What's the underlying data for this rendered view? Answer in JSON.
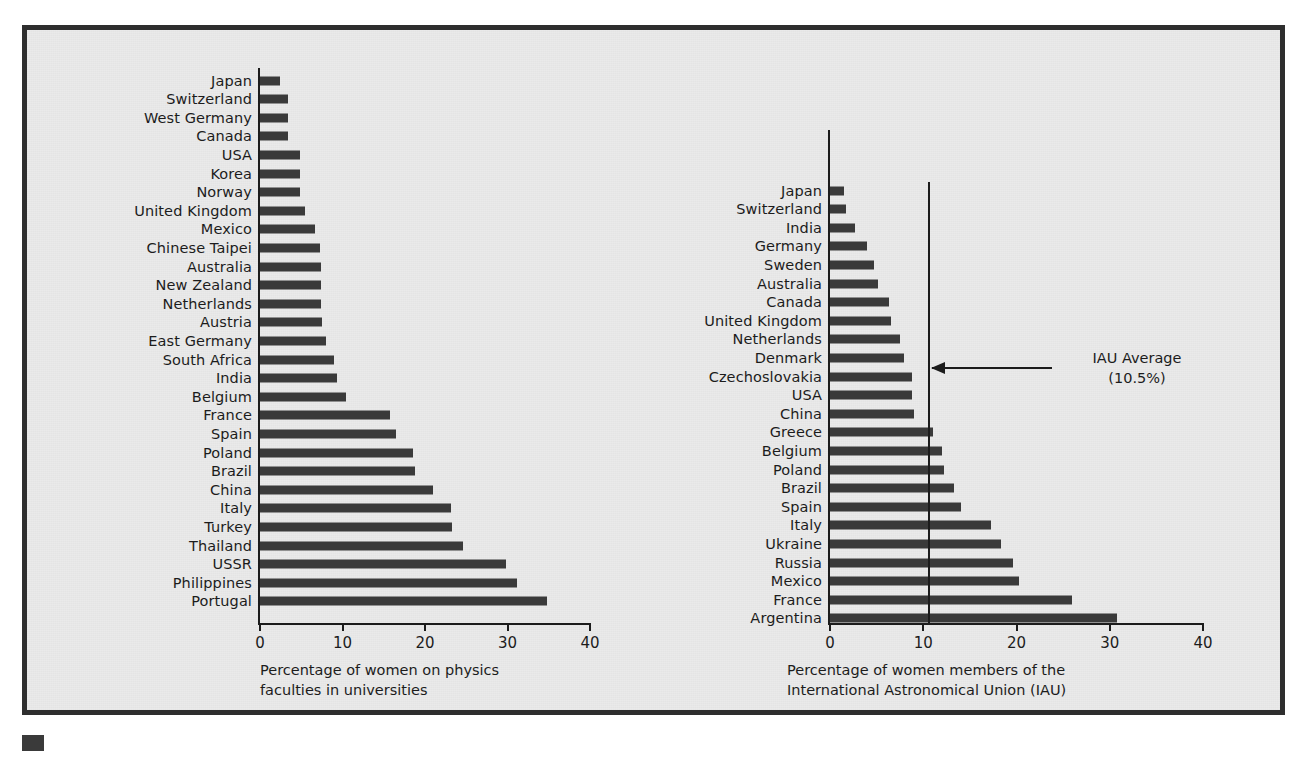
{
  "figure": {
    "background_color": "#eaeaea",
    "frame_color": "#2e2e2e",
    "bar_color": "#3a3a3a",
    "text_color": "#1c1c1c"
  },
  "chart_data": [
    {
      "type": "bar",
      "orientation": "horizontal",
      "id": "physics-faculties",
      "title": "Percentage of women on physics\nfaculties in universities",
      "xlabel": "",
      "ylabel": "",
      "xlim": [
        0,
        40
      ],
      "xticks": [
        0,
        10,
        20,
        30,
        40
      ],
      "xtick_labels": [
        "0",
        "10",
        "20",
        "30",
        "40"
      ],
      "grid": false,
      "legend": null,
      "categories": [
        "Japan",
        "Switzerland",
        "West Germany",
        "Canada",
        "USA",
        "Korea",
        "Norway",
        "United Kingdom",
        "Mexico",
        "Chinese Taipei",
        "Australia",
        "New Zealand",
        "Netherlands",
        "Austria",
        "East Germany",
        "South Africa",
        "India",
        "Belgium",
        "France",
        "Spain",
        "Poland",
        "Brazil",
        "China",
        "Italy",
        "Turkey",
        "Thailand",
        "USSR",
        "Philippines",
        "Portugal"
      ],
      "values": [
        2.4,
        3.4,
        3.4,
        3.4,
        4.8,
        4.9,
        4.9,
        5.5,
        6.7,
        7.3,
        7.4,
        7.4,
        7.4,
        7.5,
        8.0,
        9.0,
        9.3,
        10.4,
        15.8,
        16.5,
        18.5,
        18.8,
        21.0,
        23.2,
        23.3,
        24.6,
        29.8,
        31.2,
        34.8
      ]
    },
    {
      "type": "bar",
      "orientation": "horizontal",
      "id": "iau-members",
      "title": "Percentage of women members of the\nInternational Astronomical Union (IAU)",
      "xlabel": "",
      "ylabel": "",
      "xlim": [
        0,
        40
      ],
      "xticks": [
        0,
        10,
        20,
        30,
        40
      ],
      "xtick_labels": [
        "0",
        "10",
        "20",
        "30",
        "40"
      ],
      "grid": false,
      "legend": null,
      "categories": [
        "Japan",
        "Switzerland",
        "India",
        "Germany",
        "Sweden",
        "Australia",
        "Canada",
        "United Kingdom",
        "Netherlands",
        "Denmark",
        "Czechoslovakia",
        "USA",
        "China",
        "Greece",
        "Belgium",
        "Poland",
        "Brazil",
        "Spain",
        "Italy",
        "Ukraine",
        "Russia",
        "Mexico",
        "France",
        "Argentina"
      ],
      "values": [
        1.5,
        1.7,
        2.7,
        4.0,
        4.7,
        5.2,
        6.3,
        6.5,
        7.5,
        7.9,
        8.8,
        8.8,
        9.0,
        11.0,
        12.0,
        12.2,
        13.3,
        14.0,
        17.3,
        18.3,
        19.6,
        20.3,
        26.0,
        30.8
      ],
      "annotations": [
        {
          "name": "iau-average",
          "label": "IAU Average\n(10.5%)",
          "value": 10.5,
          "type": "vline-with-arrow"
        }
      ]
    }
  ]
}
